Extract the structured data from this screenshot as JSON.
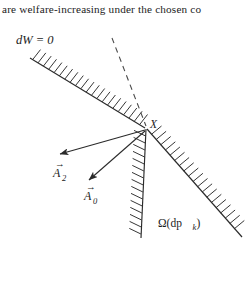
{
  "page": {
    "width": 248,
    "height": 283,
    "background": "#ffffff",
    "ink_color": "#1c1c1c"
  },
  "body_text": {
    "line": "are welfare-increasing under the chosen co"
  },
  "figure": {
    "caption_labels": {
      "dw_zero": "dW = 0",
      "vertex": "X",
      "arrow_a2": "A",
      "arrow_a2_sub": "2",
      "arrow_a0": "A",
      "arrow_a0_sub": "0",
      "cone_omega": "Ω(dp",
      "cone_omega_sub": "k",
      "cone_omega_close": ")"
    },
    "elements": {
      "hatched_line_name": "dW = 0 constraint line",
      "dashed_line_name": "dashed reference line",
      "cone_name": "feasible cone Ω(dp_k)",
      "arrows": [
        "A_2 vector arrow",
        "A_0 vector arrow"
      ]
    },
    "geometry": {
      "vertex": [
        146,
        106
      ],
      "hatched_line_start": [
        30,
        36
      ],
      "hatched_line_end": [
        144,
        106
      ],
      "dashed_line_start": [
        112,
        16
      ],
      "dashed_line_end": [
        146,
        104
      ],
      "cone_edge_left_end": [
        140,
        215
      ],
      "cone_edge_right_end": [
        241,
        214
      ],
      "arrow_a2_tip": [
        57,
        133
      ],
      "arrow_a0_tip": [
        86,
        160
      ]
    }
  }
}
